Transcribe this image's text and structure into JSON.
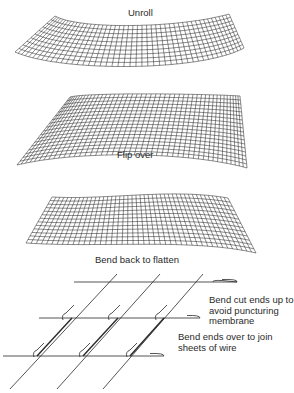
{
  "figure": {
    "steps": [
      {
        "id": "unroll",
        "label": "Unroll"
      },
      {
        "id": "flip-over",
        "label": "Flip over"
      },
      {
        "id": "bend-back",
        "label": "Bend back to flatten"
      }
    ],
    "detail": {
      "annotations": [
        {
          "id": "bend-cut-ends",
          "label": "Bend cut ends up to\navoid puncturing\nmembrane"
        },
        {
          "id": "bend-ends-over",
          "label": "Bend ends over to join\nsheets of wire"
        }
      ]
    }
  },
  "colors": {
    "line": "#2a2a2a",
    "background": "#ffffff"
  }
}
